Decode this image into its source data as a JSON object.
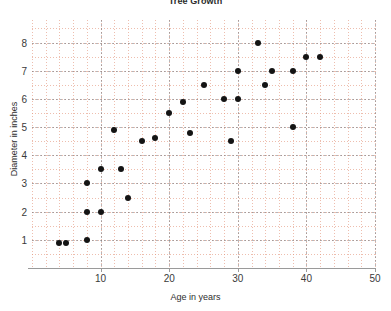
{
  "chart_data": {
    "type": "scatter",
    "title": "Tree Growth",
    "xlabel": "Age in years",
    "ylabel": "Diameter in inches",
    "xlim": [
      0,
      50
    ],
    "ylim": [
      0,
      8.8
    ],
    "xticks": [
      10,
      20,
      30,
      40,
      50
    ],
    "yticks": [
      1,
      2,
      3,
      4,
      5,
      6,
      7,
      8
    ],
    "grid": true,
    "grid_minor": true,
    "legend": "none",
    "point_color": "#141414",
    "grid_minor_color": "#e28f78",
    "grid_major_color": "#78787d",
    "series": [
      {
        "name": "Trees",
        "points": [
          [
            4,
            0.9
          ],
          [
            5,
            0.9
          ],
          [
            8,
            1.0
          ],
          [
            8,
            2.0
          ],
          [
            10,
            2.0
          ],
          [
            8,
            3.0
          ],
          [
            10,
            3.5
          ],
          [
            13,
            3.5
          ],
          [
            14,
            2.5
          ],
          [
            12,
            4.9
          ],
          [
            16,
            4.5
          ],
          [
            18,
            4.6
          ],
          [
            20,
            5.5
          ],
          [
            22,
            5.9
          ],
          [
            23,
            4.8
          ],
          [
            25,
            6.5
          ],
          [
            28,
            6.0
          ],
          [
            29,
            4.5
          ],
          [
            30,
            6.0
          ],
          [
            30,
            7.0
          ],
          [
            33,
            8.0
          ],
          [
            34,
            6.5
          ],
          [
            35,
            7.0
          ],
          [
            38,
            5.0
          ],
          [
            38,
            7.0
          ],
          [
            40,
            7.5
          ],
          [
            42,
            7.5
          ]
        ]
      }
    ]
  }
}
